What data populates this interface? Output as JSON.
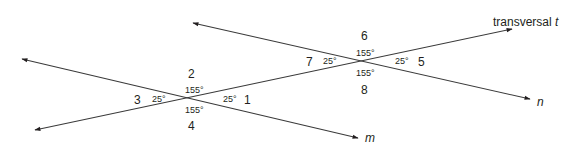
{
  "diagram": {
    "colors": {
      "line": "#3a3a3a",
      "text": "#231f20",
      "background": "#ffffff"
    },
    "lines": [
      {
        "id": "m",
        "label": "m",
        "x1": 22,
        "y1": 59,
        "x2": 358,
        "y2": 138,
        "arrows": "both"
      },
      {
        "id": "n",
        "label": "n",
        "x1": 193,
        "y1": 23,
        "x2": 530,
        "y2": 99,
        "arrows": "both"
      },
      {
        "id": "t",
        "label_prefix": "transversal ",
        "label_var": "t",
        "x1": 35,
        "y1": 130,
        "x2": 512,
        "y2": 29,
        "arrows": "both"
      }
    ],
    "intersections": [
      {
        "name": "m-t",
        "angles": [
          {
            "number": "1",
            "degrees": "25°"
          },
          {
            "number": "2",
            "degrees": "155°"
          },
          {
            "number": "3",
            "degrees": "25°"
          },
          {
            "number": "4",
            "degrees": "155°"
          }
        ]
      },
      {
        "name": "n-t",
        "angles": [
          {
            "number": "5",
            "degrees": "25°"
          },
          {
            "number": "6",
            "degrees": "155°"
          },
          {
            "number": "7",
            "degrees": "25°"
          },
          {
            "number": "8",
            "degrees": "155°"
          }
        ]
      }
    ],
    "labels": {
      "line_m": "m",
      "line_n": "n",
      "transversal_prefix": "transversal ",
      "transversal_var": "t"
    }
  }
}
